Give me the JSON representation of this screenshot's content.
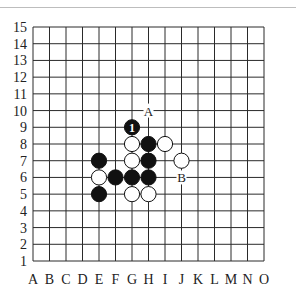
{
  "board": {
    "size": 15,
    "columns": [
      "A",
      "B",
      "C",
      "D",
      "E",
      "F",
      "G",
      "H",
      "I",
      "J",
      "K",
      "L",
      "M",
      "N",
      "O"
    ],
    "rows": [
      "1",
      "2",
      "3",
      "4",
      "5",
      "6",
      "7",
      "8",
      "9",
      "10",
      "11",
      "12",
      "13",
      "14",
      "15"
    ],
    "colors": {
      "line": "#2a2a2a",
      "black": "#111111",
      "white": "#ffffff",
      "text": "#222222"
    },
    "stones": [
      {
        "col": "G",
        "row": 9,
        "color": "black",
        "label": "1"
      },
      {
        "col": "H",
        "row": 8,
        "color": "black"
      },
      {
        "col": "H",
        "row": 7,
        "color": "black"
      },
      {
        "col": "E",
        "row": 7,
        "color": "black"
      },
      {
        "col": "F",
        "row": 6,
        "color": "black"
      },
      {
        "col": "G",
        "row": 6,
        "color": "black"
      },
      {
        "col": "H",
        "row": 6,
        "color": "black"
      },
      {
        "col": "E",
        "row": 5,
        "color": "black"
      },
      {
        "col": "G",
        "row": 8,
        "color": "white"
      },
      {
        "col": "I",
        "row": 8,
        "color": "white"
      },
      {
        "col": "G",
        "row": 7,
        "color": "white"
      },
      {
        "col": "J",
        "row": 7,
        "color": "white"
      },
      {
        "col": "E",
        "row": 6,
        "color": "white"
      },
      {
        "col": "G",
        "row": 5,
        "color": "white"
      },
      {
        "col": "H",
        "row": 5,
        "color": "white"
      }
    ],
    "markers": [
      {
        "col": "H",
        "row": 10,
        "label": "A"
      },
      {
        "col": "J",
        "row": 6,
        "label": "B"
      }
    ]
  }
}
